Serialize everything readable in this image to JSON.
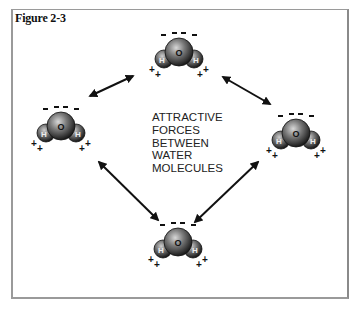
{
  "figure": {
    "title": "Figure 2-3",
    "caption_lines": [
      "ATTRACTIVE",
      "FORCES",
      "BETWEEN",
      "WATER",
      "MOLECULES"
    ]
  },
  "molecules": [
    {
      "id": "top",
      "oxygen": "O",
      "hydrogen_left": "H",
      "hydrogen_right": "H",
      "negative": "- - - -",
      "positive": "+ +"
    },
    {
      "id": "left",
      "oxygen": "O",
      "hydrogen_left": "H",
      "hydrogen_right": "H",
      "negative": "- - - -",
      "positive": "+ +"
    },
    {
      "id": "right",
      "oxygen": "O",
      "hydrogen_left": "H",
      "hydrogen_right": "H",
      "negative": "- - - -",
      "positive": "+ +"
    },
    {
      "id": "bottom",
      "oxygen": "O",
      "hydrogen_left": "H",
      "hydrogen_right": "H",
      "negative": "- - - -",
      "positive": "+ +"
    }
  ],
  "colors": {
    "sphere_dark": "#1a1a1a",
    "sphere_light": "#bdbdbd",
    "frame": "#9a9a9a",
    "arrow": "#111111"
  }
}
